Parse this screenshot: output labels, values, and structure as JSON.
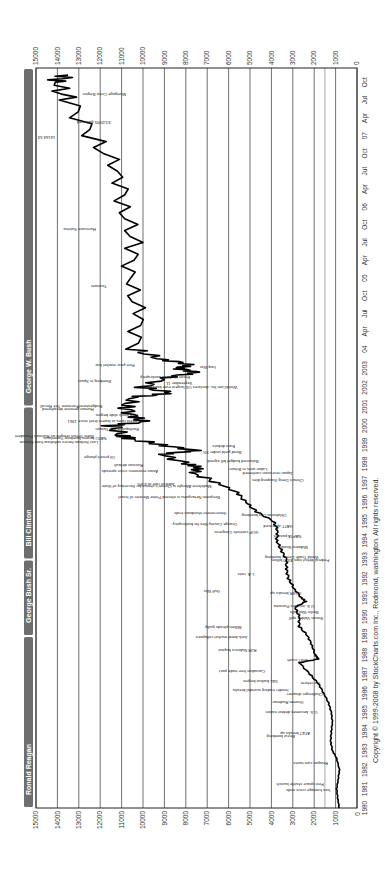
{
  "chart_data": {
    "type": "line",
    "orientation": "rotated 90 degrees counter-clockwise",
    "xlabel": "",
    "ylabel": "",
    "ylim": [
      0,
      15000
    ],
    "y_ticks": [
      0,
      1000,
      2000,
      3000,
      4000,
      5000,
      6000,
      7000,
      8000,
      9000,
      10000,
      11000,
      12000,
      13000,
      14000,
      15000
    ],
    "x_ticks": [
      "1980",
      "1981",
      "1982",
      "1983",
      "1984",
      "1985",
      "1986",
      "1987",
      "1988",
      "1989",
      "1990",
      "1991",
      "1992",
      "1993",
      "1994",
      "1995",
      "1996",
      "1997",
      "1998",
      "1999",
      "2000",
      "2001",
      "2002",
      "2003",
      "04",
      "Apr",
      "Jul",
      "Oct",
      "05",
      "Apr",
      "Jul",
      "Oct",
      "06",
      "Apr",
      "Jul",
      "Oct",
      "07",
      "Apr",
      "Jul",
      "Oct"
    ],
    "grid": true,
    "series": [
      {
        "name": "DJIA",
        "x": [
          1980.0,
          1980.5,
          1981.0,
          1981.5,
          1982.0,
          1982.6,
          1983.0,
          1983.5,
          1984.0,
          1984.5,
          1985.0,
          1985.5,
          1986.0,
          1986.5,
          1987.0,
          1987.6,
          1987.8,
          1988.0,
          1988.5,
          1989.0,
          1989.5,
          1990.0,
          1990.5,
          1990.8,
          1991.0,
          1991.5,
          1992.0,
          1992.5,
          1993.0,
          1993.5,
          1994.0,
          1994.5,
          1995.0,
          1995.5,
          1996.0,
          1996.5,
          1997.0,
          1997.5,
          1997.8,
          1998.0,
          1998.5,
          1998.7,
          1999.0,
          1999.3,
          1999.5,
          2000.0,
          2000.2,
          2000.5,
          2001.0,
          2001.5,
          2001.7,
          2002.0,
          2002.5,
          2002.8,
          2003.0,
          2003.2,
          2003.5,
          2004.0,
          2004.5,
          2005.0,
          2005.5,
          2006.0,
          2006.5,
          2007.0,
          2007.5,
          2007.75,
          2007.85
        ],
        "values": [
          830,
          900,
          950,
          880,
          820,
          950,
          1150,
          1230,
          1200,
          1150,
          1200,
          1330,
          1550,
          1800,
          2200,
          2700,
          1800,
          1950,
          2100,
          2300,
          2700,
          2700,
          2900,
          2400,
          2600,
          2950,
          3200,
          3300,
          3300,
          3550,
          3750,
          3700,
          3900,
          4700,
          5200,
          5600,
          6500,
          7600,
          7400,
          7900,
          9200,
          7500,
          9200,
          10500,
          11000,
          11500,
          10000,
          10500,
          10800,
          10400,
          8600,
          10000,
          9000,
          7500,
          8400,
          7800,
          9200,
          10400,
          10200,
          10700,
          10400,
          10900,
          11100,
          12400,
          13500,
          14164,
          13500
        ]
      }
    ],
    "annotations": [
      "Iran hostage crisis ends",
      "First space shuttle launch",
      "Reagan cuts taxes",
      "Beirut bombing",
      "AT&T breaks up",
      "U.S. becomes debtor nation",
      "Gramm-Rudman",
      "Challenger disaster",
      "Insider trading scandal breaks",
      "S&L bailout begins",
      "Tax reform",
      "Canadian free trade pact",
      "1987 crash",
      "RJR Nabisco buyout",
      "Junk-bond market collapses",
      "Milken pleads guilty",
      "Exxon Valdez spill",
      "Berlin Wall falls",
      "U.S. invades Panama",
      "USSR breaks up",
      "Gulf War",
      "L.A. riots",
      "Federal deficit tops $300 billion",
      "World Trade Center bombing",
      "Midwest floods",
      "NAFTA passes",
      "GATT approved",
      "Oklahoma City bombing",
      "GOP controls Congress",
      "Orange County files for bankruptcy",
      "Government shutdown ends",
      "Benjamin Netanyahu is elected Prime Minister of Israel",
      "Madeleine Albright is Clinton's choice for Secretary of State",
      "Jobless rate at 4.8%",
      "Asian economic crisis spreads",
      "Russian default",
      "Oil prices plunge",
      "China's Deng Xiaoping dies",
      "Japan recession confirmed",
      "Labor wins in Britain",
      "Balanced budget bill signed",
      "Bond yield under 5%",
      "Euro debuts",
      "Boris Yeltsin resigns as Russia's President",
      "Last Serbian forces withdraw from Kosovo",
      "NATO begins bombing Yugoslavia",
      "Earthquake hits Taiwan",
      "Interest rates at lowest level since 1961",
      "Tech stock slide begins",
      "Human genome deciphered",
      "Bridgestone/Firestone Tire Recall",
      "Bombing in Spain",
      "Enron declares bankruptcy",
      "WorldCom Inc. declares US largest ever bankruptcy",
      "September 11",
      "Iraq War",
      "Five-year market low",
      "Tsunami",
      "Hurricane Katrina",
      "Mortgage Crisis Begins",
      "3/1/2005 gathered",
      "14164.53"
    ],
    "peak_label": "14164.53",
    "presidents": [
      "Ronald Reagan",
      "George Bush Sr.",
      "Bill Clinton",
      "George W. Bush"
    ]
  },
  "footer": {
    "copyright": "Copyright © 1999-2008 by StockCharts.com Inc., Redmond, washington. All rights reserved."
  }
}
